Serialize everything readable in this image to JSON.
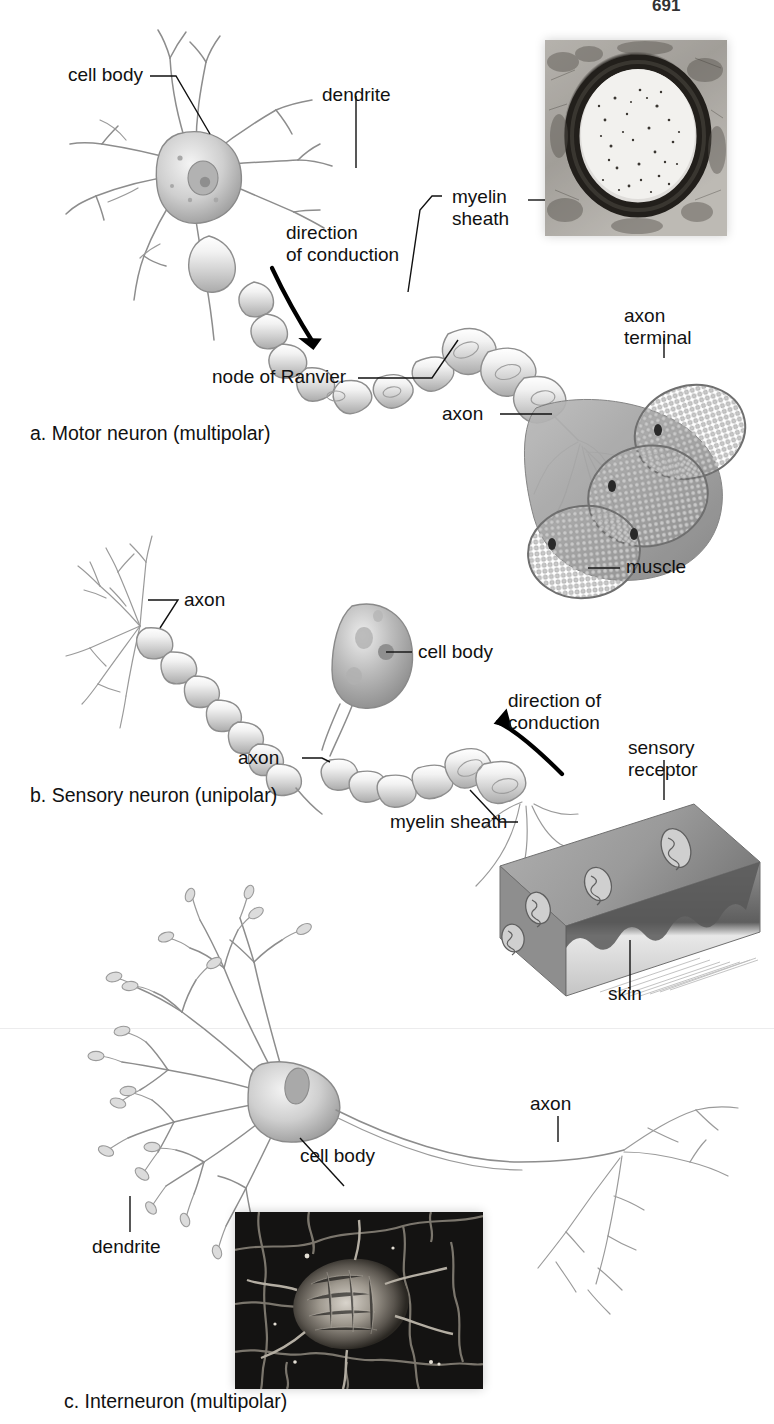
{
  "figure": {
    "page_number": "691",
    "domain": "anatomy-diagram"
  },
  "panels": [
    {
      "id": "a",
      "caption": "a. Motor neuron (multipolar)",
      "labels": [
        {
          "key": "cell_body",
          "text": "cell body"
        },
        {
          "key": "dendrite",
          "text": "dendrite"
        },
        {
          "key": "direction",
          "text": "direction\nof conduction"
        },
        {
          "key": "myelin",
          "text": "myelin\nsheath"
        },
        {
          "key": "node",
          "text": "node of Ranvier"
        },
        {
          "key": "axon",
          "text": "axon"
        },
        {
          "key": "axon_term",
          "text": "axon\nterminal"
        },
        {
          "key": "muscle",
          "text": "muscle"
        }
      ],
      "micrograph": {
        "name": "myelinated-axon-cross-section",
        "caption": ""
      }
    },
    {
      "id": "b",
      "caption": "b. Sensory neuron (unipolar)",
      "labels": [
        {
          "key": "axon_left",
          "text": "axon"
        },
        {
          "key": "cell_body",
          "text": "cell body"
        },
        {
          "key": "axon_lower",
          "text": "axon"
        },
        {
          "key": "direction",
          "text": "direction of\nconduction"
        },
        {
          "key": "sensory",
          "text": "sensory\nreceptor"
        },
        {
          "key": "myelin",
          "text": "myelin sheath"
        },
        {
          "key": "skin",
          "text": "skin"
        }
      ]
    },
    {
      "id": "c",
      "caption": "c. Interneuron (multipolar)",
      "labels": [
        {
          "key": "cell_body",
          "text": "cell body"
        },
        {
          "key": "dendrite",
          "text": "dendrite"
        },
        {
          "key": "axon",
          "text": "axon"
        }
      ],
      "micrograph": {
        "name": "neuron-cell-body-sem",
        "caption": ""
      }
    }
  ],
  "colors": {
    "ink": "#111111",
    "line_art": "#8d8d8d",
    "background": "#ffffff",
    "micrograph_dark": "#1d1d1d",
    "micrograph_mid": "#8c8c8c",
    "skin_tone": "#9a9a9a"
  }
}
